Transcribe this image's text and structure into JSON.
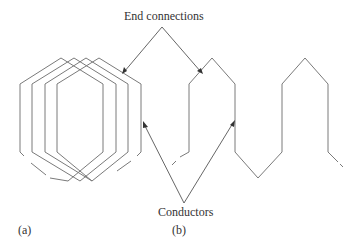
{
  "figure": {
    "labels": {
      "end_connections": "End connections",
      "conductors": "Conductors",
      "panel_a": "(a)",
      "panel_b": "(b)"
    },
    "colors": {
      "line": "#7a7a7a",
      "arrow": "#555555",
      "text": "#333333",
      "background": "#ffffff"
    },
    "panel_a": {
      "description": "Four overlapping lap-wound coils (nested hexagonal loops)",
      "coil_count": 4
    },
    "panel_b": {
      "description": "Wave winding with alternating peaks and valleys",
      "peaks": 2,
      "valleys": 1
    }
  }
}
